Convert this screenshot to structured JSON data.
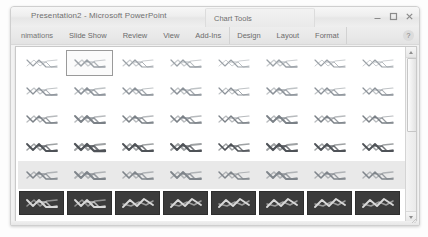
{
  "window": {
    "title": "Presentation2 - Microsoft PowerPoint",
    "contextual_tab_group": "Chart Tools",
    "controls": [
      {
        "name": "minimize",
        "glyph": "–"
      },
      {
        "name": "restore",
        "glyph": "❐"
      },
      {
        "name": "close",
        "glyph": "✕"
      }
    ],
    "help_label": "?"
  },
  "ribbon": {
    "tabs": [
      {
        "label": "nimations",
        "group": "main",
        "truncated": true
      },
      {
        "label": "Slide Show",
        "group": "main"
      },
      {
        "label": "Review",
        "group": "main"
      },
      {
        "label": "View",
        "group": "main"
      },
      {
        "label": "Add-Ins",
        "group": "main"
      },
      {
        "label": "Design",
        "group": "chart-tools"
      },
      {
        "label": "Layout",
        "group": "chart-tools"
      },
      {
        "label": "Format",
        "group": "chart-tools"
      }
    ]
  },
  "gallery": {
    "name": "chart-styles-gallery",
    "columns": 8,
    "selected_index": 1,
    "rows": [
      {
        "index": 0,
        "background": "white",
        "stroke": "#9aa0a6",
        "weight": 1.3
      },
      {
        "index": 1,
        "background": "white",
        "stroke": "#8b9198",
        "weight": 1.5
      },
      {
        "index": 2,
        "background": "white",
        "stroke": "#7b8187",
        "weight": 1.7
      },
      {
        "index": 3,
        "background": "white",
        "stroke": "#4f5358",
        "weight": 2.1
      },
      {
        "index": 4,
        "background": "light",
        "stroke": "#7f858b",
        "weight": 1.8
      },
      {
        "index": 5,
        "background": "dark",
        "stroke": "#d8d8d8",
        "weight": 1.9
      }
    ],
    "cell_tooltip": "Style"
  },
  "scrollbar": {
    "name": "gallery-vertical-scrollbar",
    "up_arrow": "▲",
    "down_arrow": "▼",
    "position_percent": 6
  },
  "colors": {
    "window_chrome": "#f2f2f2",
    "gallery_background": "#ffffff",
    "row_shade": "#e9e9e9",
    "dark_thumb": "#3b3b3b",
    "selection_border": "#9a9a9a"
  }
}
